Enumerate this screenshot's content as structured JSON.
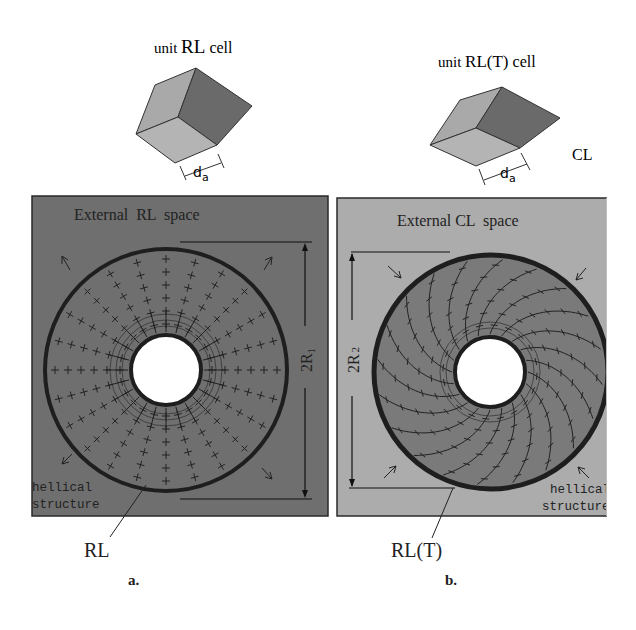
{
  "figure": {
    "panel_a": {
      "letter": "a.",
      "cell_title": "unit RL cell",
      "cell_title_parts": [
        "unit ",
        "RL",
        " cell"
      ],
      "cell_dimension": "d",
      "cell_dimension_sub": "a",
      "space_label": "External  RL  space",
      "diameter_label": "2R",
      "diameter_sub": "1",
      "helical_label_line1": "hellical",
      "helical_label_line2": "structure",
      "layer_label": "RL",
      "arrow_direction": "outward",
      "colors": {
        "background": "#6f6f6f",
        "annulus": "#6f6f6f",
        "ring": "#1e1e1e",
        "hole": "#ffffff"
      }
    },
    "panel_b": {
      "letter": "b.",
      "cell_title": "unit RL(T) cell",
      "cell_title_parts": [
        "unit ",
        "RL(T)",
        " cell"
      ],
      "cell_dimension": "d",
      "cell_dimension_sub": "a",
      "side_label": "CL",
      "space_label": "External CL  space",
      "diameter_label": "2R",
      "diameter_sub": "2",
      "helical_label_line1": "hellical",
      "helical_label_line2": "structure",
      "layer_label": "RL(T)",
      "arrow_direction": "inward",
      "colors": {
        "background": "#acacac",
        "annulus": "#7a7a7a",
        "ring": "#1e1e1e",
        "hole": "#ffffff"
      }
    },
    "cube_colors": {
      "light_face": "#a9a9a9",
      "dark_face": "#6a6a6a",
      "bottom_face": "#b4b4b4",
      "edge": "#333333"
    }
  }
}
